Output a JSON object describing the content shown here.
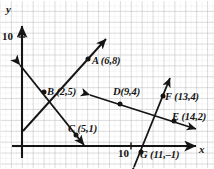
{
  "figure": {
    "kind": "coordinate-plane-diagram",
    "axes": {
      "x_label": "x",
      "y_label": "y",
      "x_tick_label": "10",
      "y_tick_label": "10",
      "origin_px": [
        22,
        146
      ],
      "unit_px": 10.9,
      "grid": "dotted-gray-minor-with-solid-major",
      "axis_color": "#1a1a1a",
      "grid_color": "#c9c9c9"
    },
    "points": [
      {
        "id": "A",
        "label": "A (6,8)",
        "x": 6,
        "y": 8
      },
      {
        "id": "B",
        "label": "B (2,5)",
        "x": 2,
        "y": 5
      },
      {
        "id": "C",
        "label": "C (5,1)",
        "x": 5,
        "y": 1
      },
      {
        "id": "D",
        "label": "D(9,4)",
        "x": 9,
        "y": 4
      },
      {
        "id": "E",
        "label": "E (14,2)",
        "x": 14,
        "y": 2
      },
      {
        "id": "F",
        "label": "F (13,4)",
        "x": 13,
        "y": 4
      },
      {
        "id": "G",
        "label": "G (11,–1)",
        "x": 11,
        "y": -1
      }
    ],
    "lines": [
      {
        "id": "line-AB",
        "through": [
          "B",
          "A"
        ],
        "arrows": "end",
        "note": "rises left-to-right through B(2,5) and A(6,8)"
      },
      {
        "id": "line-BC",
        "through": [
          "B",
          "C"
        ],
        "arrows": "both",
        "note": "falls left-to-right through B(2,5) and C(5,1)"
      },
      {
        "id": "line-DE",
        "through": [
          "D",
          "E"
        ],
        "arrows": "both",
        "note": "falls gently through D(9,4) and E(14,2)"
      },
      {
        "id": "line-FG",
        "through": [
          "G",
          "F"
        ],
        "arrows": "both",
        "note": "steep line through G(11,-1) and F(13,4)"
      }
    ]
  }
}
